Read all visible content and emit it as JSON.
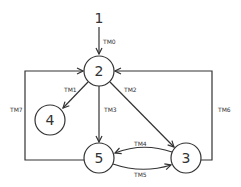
{
  "diagram": {
    "type": "state-transition-graph",
    "nodes": [
      {
        "id": "1",
        "label": "1",
        "x": 99,
        "y": 18,
        "circle": false
      },
      {
        "id": "2",
        "label": "2",
        "x": 99,
        "y": 71,
        "circle": true
      },
      {
        "id": "3",
        "label": "3",
        "x": 186,
        "y": 158,
        "circle": true
      },
      {
        "id": "4",
        "label": "4",
        "x": 50,
        "y": 120,
        "circle": true
      },
      {
        "id": "5",
        "label": "5",
        "x": 99,
        "y": 158,
        "circle": true
      }
    ],
    "edges": [
      {
        "id": "TM0",
        "label": "TM0",
        "from": "1",
        "to": "2"
      },
      {
        "id": "TM1",
        "label": "TM1",
        "from": "2",
        "to": "4"
      },
      {
        "id": "TM2",
        "label": "TM2",
        "from": "2",
        "to": "3"
      },
      {
        "id": "TM3",
        "label": "TM3",
        "from": "2",
        "to": "5"
      },
      {
        "id": "TM4",
        "label": "TM4",
        "from": "3",
        "to": "5"
      },
      {
        "id": "TM5",
        "label": "TM5",
        "from": "5",
        "to": "3"
      },
      {
        "id": "TM6",
        "label": "TM6",
        "from": "3",
        "to": "2"
      },
      {
        "id": "TM7",
        "label": "TM7",
        "from": "5",
        "to": "2"
      }
    ]
  }
}
